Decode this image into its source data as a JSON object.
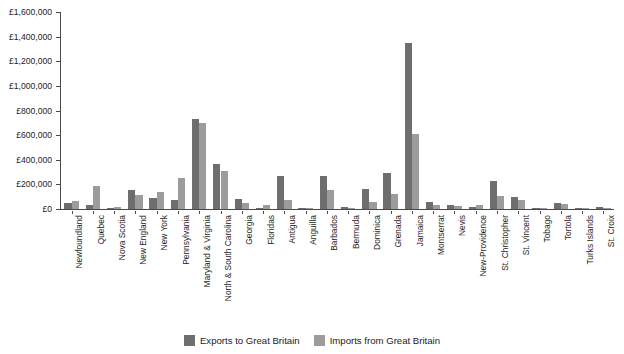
{
  "chart_data": {
    "type": "bar",
    "title": "",
    "xlabel": "",
    "ylabel": "",
    "ylim": [
      0,
      1600000
    ],
    "ytick_values": [
      0,
      200000,
      400000,
      600000,
      800000,
      1000000,
      1200000,
      1400000,
      1600000
    ],
    "ytick_labels": [
      "£0",
      "£200,000",
      "£400,000",
      "£600,000",
      "£800,000",
      "£1,000,000",
      "£1,200,000",
      "£1,400,000",
      "£1,600,000"
    ],
    "grid": false,
    "legend_position": "bottom",
    "currency_symbol": "£",
    "categories": [
      "Newfoundland",
      "Quebec",
      "Nova Scotia",
      "New England",
      "New York",
      "Pennsylvania",
      "Maryland & Virginia",
      "North & South Carolina",
      "Georgia",
      "Floridas",
      "Antigua",
      "Anguilla",
      "Barbados",
      "Bermuda",
      "Dominica",
      "Grenada",
      "Jamaica",
      "Montserrat",
      "Nevis",
      "New-Providence",
      "St. Christopher",
      "St. Vincent",
      "Tobago",
      "Tortola",
      "Turks Islands",
      "St. Croix"
    ],
    "series": [
      {
        "name": "Exports to Great Britain",
        "color": "#6e6e6e",
        "values": [
          50000,
          35000,
          5000,
          155000,
          90000,
          70000,
          730000,
          365000,
          80000,
          10000,
          265000,
          10000,
          265000,
          15000,
          160000,
          290000,
          1345000,
          60000,
          35000,
          15000,
          225000,
          95000,
          5000,
          45000,
          5000,
          15000
        ]
      },
      {
        "name": "Imports from Great Britain",
        "color": "#9c9c9c",
        "values": [
          65000,
          185000,
          20000,
          110000,
          140000,
          250000,
          695000,
          305000,
          45000,
          35000,
          75000,
          5000,
          155000,
          12000,
          60000,
          120000,
          610000,
          30000,
          25000,
          35000,
          105000,
          70000,
          5000,
          40000,
          5000,
          10000
        ]
      }
    ]
  },
  "legend": {
    "items": [
      {
        "label": "Exports to Great Britain",
        "color": "#6e6e6e"
      },
      {
        "label": "Imports from Great Britain",
        "color": "#9c9c9c"
      }
    ]
  }
}
